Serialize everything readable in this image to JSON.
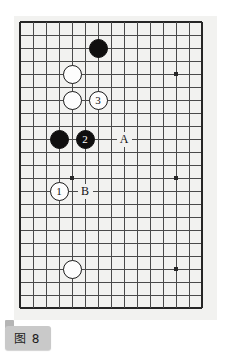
{
  "figure": {
    "caption": "图 8",
    "caption_bg": "#c9c9c9",
    "board_bg": "#f2f2f0",
    "line_color": "#4a4a4a",
    "border_color": "#262626",
    "black_color": "#100f0f",
    "white_color": "#fdfdfd"
  },
  "board": {
    "cols": 15,
    "rows": 23,
    "cell": 13,
    "origin_x": 6,
    "origin_y": 6,
    "star_points": [
      {
        "col": 12,
        "row": 4
      },
      {
        "col": 4,
        "row": 12
      },
      {
        "col": 12,
        "row": 12
      },
      {
        "col": 4,
        "row": 19
      },
      {
        "col": 12,
        "row": 19
      }
    ]
  },
  "stones": [
    {
      "id": "black-stone-top",
      "color": "black",
      "label": "",
      "col": 6,
      "row": 2
    },
    {
      "id": "white-stone-upper",
      "color": "white",
      "label": "",
      "col": 4,
      "row": 4
    },
    {
      "id": "white-stone-middle",
      "color": "white",
      "label": "",
      "col": 4,
      "row": 6
    },
    {
      "id": "white-move-3",
      "color": "white",
      "label": "3",
      "col": 6,
      "row": 6
    },
    {
      "id": "black-stone-left",
      "color": "black",
      "label": "",
      "col": 3,
      "row": 9
    },
    {
      "id": "black-move-2",
      "color": "black",
      "label": "2",
      "col": 5,
      "row": 9
    },
    {
      "id": "white-move-1",
      "color": "white",
      "label": "1",
      "col": 3,
      "row": 13
    },
    {
      "id": "white-stone-lower",
      "color": "white",
      "label": "",
      "col": 4,
      "row": 19
    }
  ],
  "labels": [
    {
      "id": "point-label-a",
      "text": "A",
      "col": 8,
      "row": 9
    },
    {
      "id": "point-label-b",
      "text": "B",
      "col": 5,
      "row": 13
    }
  ]
}
